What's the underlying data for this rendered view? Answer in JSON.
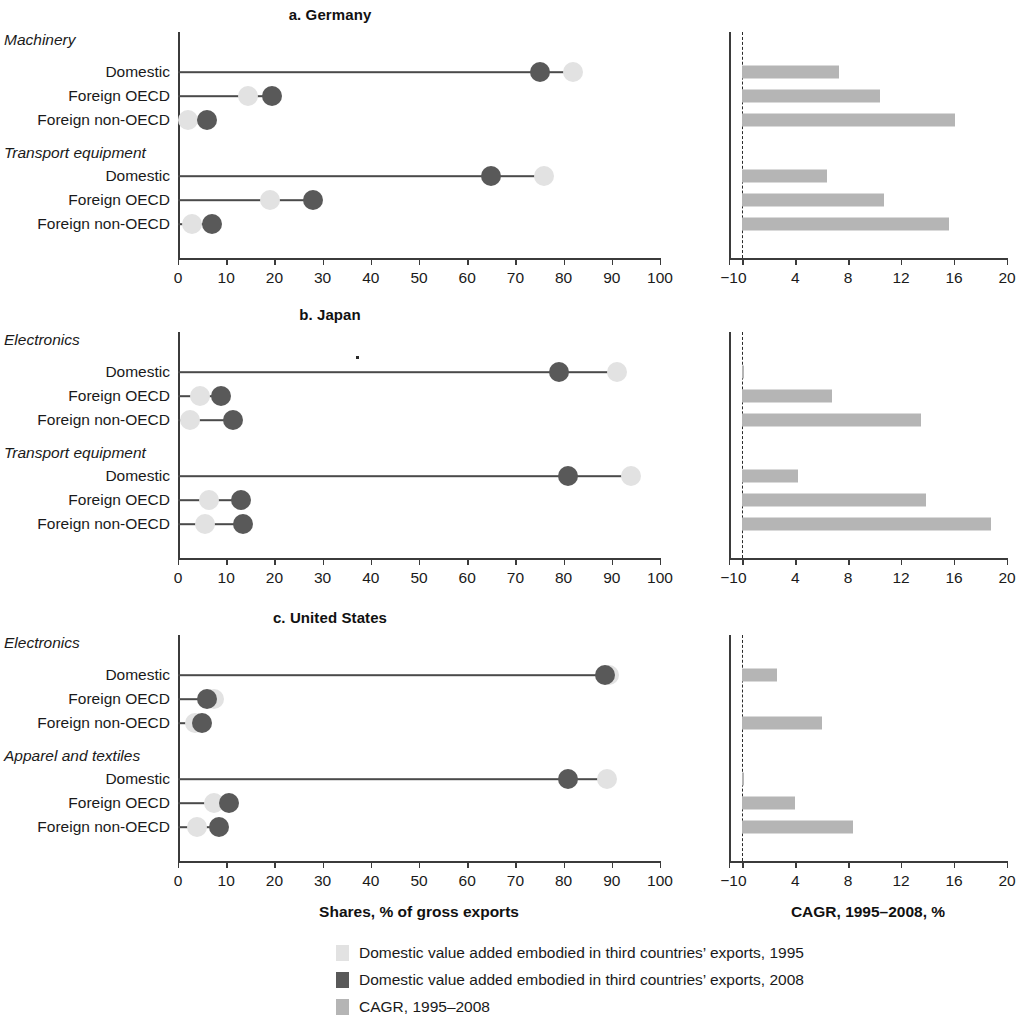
{
  "figure": {
    "left_axis_caption": "Shares, % of gross exports",
    "right_axis_caption": "CAGR, 1995–2008, %"
  },
  "legend": {
    "items": [
      {
        "label": "Domestic value added embodied in third countries’ exports, 1995",
        "color": "#e2e2e2",
        "key": "dva-1995"
      },
      {
        "label": "Domestic value added embodied in third countries’ exports, 2008",
        "color": "#595959",
        "key": "dva-2008"
      },
      {
        "label": "CAGR, 1995–2008",
        "color": "#b5b5b5",
        "key": "cagr"
      }
    ]
  },
  "axes": {
    "left": {
      "ticks": [
        "0",
        "10",
        "20",
        "30",
        "40",
        "50",
        "60",
        "70",
        "80",
        "90",
        "100"
      ],
      "min": 0,
      "max": 100
    },
    "right": {
      "ticks": [
        "−1",
        "0",
        "4",
        "8",
        "12",
        "16",
        "20"
      ],
      "min": -1,
      "max": 20
    }
  },
  "row_labels": {
    "domestic": "Domestic",
    "foreign_oecd": "Foreign OECD",
    "foreign_non_oecd": "Foreign non-OECD"
  },
  "panels": [
    {
      "id": "germany",
      "title": "a. Germany",
      "groups": [
        {
          "name": "Machinery",
          "rows": [
            {
              "label": "Domestic",
              "v1995": 82.0,
              "v2008": 75.0,
              "cagr": 7.3
            },
            {
              "label": "Foreign OECD",
              "v1995": 14.5,
              "v2008": 19.5,
              "cagr": 10.4
            },
            {
              "label": "Foreign non-OECD",
              "v1995": 2.0,
              "v2008": 6.0,
              "cagr": 16.1
            }
          ]
        },
        {
          "name": "Transport equipment",
          "rows": [
            {
              "label": "Domestic",
              "v1995": 76.0,
              "v2008": 65.0,
              "cagr": 6.4
            },
            {
              "label": "Foreign OECD",
              "v1995": 19.0,
              "v2008": 28.0,
              "cagr": 10.7
            },
            {
              "label": "Foreign non-OECD",
              "v1995": 3.0,
              "v2008": 7.0,
              "cagr": 15.6
            }
          ]
        }
      ]
    },
    {
      "id": "japan",
      "title": "b. Japan",
      "groups": [
        {
          "name": "Electronics",
          "rows": [
            {
              "label": "Domestic",
              "v1995": 91.0,
              "v2008": 79.0,
              "cagr": 0.1
            },
            {
              "label": "Foreign OECD",
              "v1995": 4.5,
              "v2008": 9.0,
              "cagr": 6.8
            },
            {
              "label": "Foreign non-OECD",
              "v1995": 2.5,
              "v2008": 11.5,
              "cagr": 13.5
            }
          ]
        },
        {
          "name": "Transport equipment",
          "rows": [
            {
              "label": "Domestic",
              "v1995": 94.0,
              "v2008": 81.0,
              "cagr": 4.2
            },
            {
              "label": "Foreign OECD",
              "v1995": 6.5,
              "v2008": 13.0,
              "cagr": 13.9
            },
            {
              "label": "Foreign non-OECD",
              "v1995": 5.5,
              "v2008": 13.5,
              "cagr": 18.8
            }
          ]
        }
      ]
    },
    {
      "id": "united-states",
      "title": "c. United States",
      "groups": [
        {
          "name": "Electronics",
          "rows": [
            {
              "label": "Domestic",
              "v1995": 89.5,
              "v2008": 88.5,
              "cagr": 2.6
            },
            {
              "label": "Foreign OECD",
              "v1995": 7.5,
              "v2008": 6.0,
              "cagr": 0.0
            },
            {
              "label": "Foreign non-OECD",
              "v1995": 3.5,
              "v2008": 5.0,
              "cagr": 6.0
            }
          ]
        },
        {
          "name": "Apparel and textiles",
          "rows": [
            {
              "label": "Domestic",
              "v1995": 89.0,
              "v2008": 81.0,
              "cagr": 0.1
            },
            {
              "label": "Foreign OECD",
              "v1995": 7.5,
              "v2008": 10.5,
              "cagr": 4.0
            },
            {
              "label": "Foreign non-OECD",
              "v1995": 4.0,
              "v2008": 8.5,
              "cagr": 8.4
            }
          ]
        }
      ]
    }
  ],
  "chart_data": {
    "type": "scatter",
    "xlabel": "Shares, % of gross exports",
    "xlabel_secondary": "CAGR, 1995–2008, %",
    "ylabel": "",
    "xlim": [
      0,
      100
    ],
    "xlim_secondary": [
      -1,
      20
    ],
    "grid": false,
    "legend_position": "bottom",
    "xticks": [
      0,
      10,
      20,
      30,
      40,
      50,
      60,
      70,
      80,
      90,
      100
    ],
    "xticks_secondary": [
      -1,
      0,
      4,
      8,
      12,
      16,
      20
    ],
    "series": [
      {
        "name": "Domestic value added embodied in third countries’ exports, 1995",
        "color": "#e2e2e2"
      },
      {
        "name": "Domestic value added embodied in third countries’ exports, 2008",
        "color": "#595959"
      },
      {
        "name": "CAGR, 1995–2008",
        "color": "#b5b5b5"
      }
    ],
    "panels": [
      {
        "panel": "a. Germany",
        "categories": [
          "Machinery / Domestic",
          "Machinery / Foreign OECD",
          "Machinery / Foreign non-OECD",
          "Transport equipment / Domestic",
          "Transport equipment / Foreign OECD",
          "Transport equipment / Foreign non-OECD"
        ],
        "values_1995": [
          82.0,
          14.5,
          2.0,
          76.0,
          19.0,
          3.0
        ],
        "values_2008": [
          75.0,
          19.5,
          6.0,
          65.0,
          28.0,
          7.0
        ],
        "cagr": [
          7.3,
          10.4,
          16.1,
          6.4,
          10.7,
          15.6
        ]
      },
      {
        "panel": "b. Japan",
        "categories": [
          "Electronics / Domestic",
          "Electronics / Foreign OECD",
          "Electronics / Foreign non-OECD",
          "Transport equipment / Domestic",
          "Transport equipment / Foreign OECD",
          "Transport equipment / Foreign non-OECD"
        ],
        "values_1995": [
          91.0,
          4.5,
          2.5,
          94.0,
          6.5,
          5.5
        ],
        "values_2008": [
          79.0,
          9.0,
          11.5,
          81.0,
          13.0,
          13.5
        ],
        "cagr": [
          0.1,
          6.8,
          13.5,
          4.2,
          13.9,
          18.8
        ]
      },
      {
        "panel": "c. United States",
        "categories": [
          "Electronics / Domestic",
          "Electronics / Foreign OECD",
          "Electronics / Foreign non-OECD",
          "Apparel and textiles / Domestic",
          "Apparel and textiles / Foreign OECD",
          "Apparel and textiles / Foreign non-OECD"
        ],
        "values_1995": [
          89.5,
          7.5,
          3.5,
          89.0,
          7.5,
          4.0
        ],
        "values_2008": [
          88.5,
          6.0,
          5.0,
          81.0,
          10.5,
          8.5
        ],
        "cagr": [
          2.6,
          0.0,
          6.0,
          0.1,
          4.0,
          8.4
        ]
      }
    ]
  }
}
